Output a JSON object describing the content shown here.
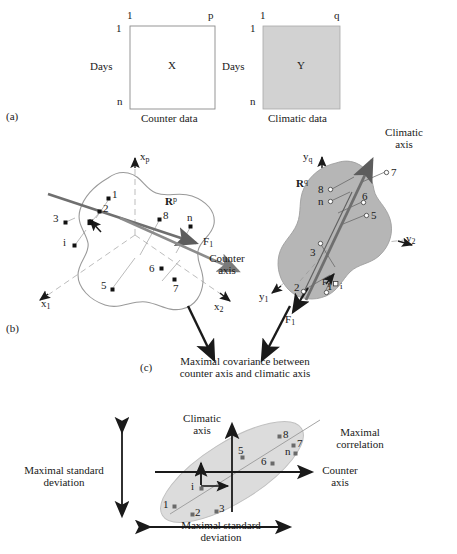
{
  "figure": {
    "domain": "scientific-diagram",
    "panels": [
      "(a)",
      "(b)",
      "(c)"
    ],
    "colors": {
      "ink": "#1a1a1a",
      "matrix_fill": "#d2d2d2",
      "blob_fill_right": "#b6b6b6",
      "blob_outline_left": "#9a9a9a",
      "axis_gray": "#7a7a7a",
      "ellipse_fill": "#dcdcdc",
      "dashed_gray": "#bdbdbd"
    }
  },
  "panel_a": {
    "tag": "(a)",
    "counter_matrix": {
      "symbol": "X",
      "caption": "Counter data",
      "col_first": "1",
      "col_last": "p",
      "row_first": "1",
      "row_last": "n",
      "row_axis_label": "Days"
    },
    "climatic_matrix": {
      "symbol": "Y",
      "caption": "Climatic data",
      "col_first": "1",
      "col_last": "q",
      "row_first": "1",
      "row_last": "n",
      "row_axis_label": "Days"
    }
  },
  "panel_b": {
    "tag": "(b)",
    "counter_space": {
      "space_symbol": "R",
      "space_exponent": "p",
      "axis_vertical": "x",
      "axis_vertical_sub": "p",
      "axis_left": "x",
      "axis_left_sub": "1",
      "axis_right": "x",
      "axis_right_sub": "2",
      "factor_label": "F",
      "factor_sub": "1",
      "axis_name_line1": "Counter",
      "axis_name_line2": "axis",
      "points": [
        "1",
        "2",
        "3",
        "i",
        "8",
        "n",
        "5",
        "6",
        "7"
      ]
    },
    "climatic_space": {
      "space_symbol": "R",
      "space_exponent": "q",
      "axis_vertical": "y",
      "axis_vertical_sub": "q",
      "axis_left": "y",
      "axis_left_sub": "1",
      "axis_right": "y",
      "axis_right_sub": "2",
      "factor_label_top": "F",
      "factor_top_sub": "1",
      "factor_label_bottom": "F",
      "factor_bottom_sub": "1",
      "axis_name_line1": "Climatic",
      "axis_name_line2": "axis",
      "points": [
        "8",
        "n",
        "7",
        "6",
        "5",
        "3",
        "i",
        "2",
        "1"
      ]
    }
  },
  "panel_c": {
    "tag": "(c)",
    "headline_line1": "Maximal covariance between",
    "headline_line2": "counter axis and climatic axis",
    "vertical_axis_line1": "Climatic",
    "vertical_axis_line2": "axis",
    "horizontal_axis_line1": "Counter",
    "horizontal_axis_line2": "axis",
    "correlation_line1": "Maximal",
    "correlation_line2": "correlation",
    "left_measure_line1": "Maximal standard",
    "left_measure_line2": "deviation",
    "bottom_measure_line1": "Maximal standard",
    "bottom_measure_line2": "deviation",
    "points": [
      "8",
      "7",
      "5",
      "n",
      "6",
      "i",
      "1",
      "2",
      "3"
    ]
  }
}
